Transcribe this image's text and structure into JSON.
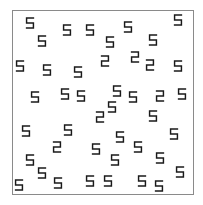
{
  "frame": {
    "x": 12,
    "y": 10,
    "width": 182,
    "height": 185,
    "border_color": "#8a8a8a"
  },
  "glyph_color": "#1a1a1a",
  "glyphs": [
    {
      "char": "5",
      "x": 30,
      "y": 23
    },
    {
      "char": "5",
      "x": 42,
      "y": 41
    },
    {
      "char": "5",
      "x": 67,
      "y": 30
    },
    {
      "char": "5",
      "x": 90,
      "y": 30
    },
    {
      "char": "5",
      "x": 110,
      "y": 42
    },
    {
      "char": "5",
      "x": 128,
      "y": 27
    },
    {
      "char": "5",
      "x": 153,
      "y": 40
    },
    {
      "char": "5",
      "x": 178,
      "y": 20
    },
    {
      "char": "5",
      "x": 20,
      "y": 66
    },
    {
      "char": "5",
      "x": 47,
      "y": 70
    },
    {
      "char": "5",
      "x": 78,
      "y": 72
    },
    {
      "char": "2",
      "x": 105,
      "y": 61
    },
    {
      "char": "2",
      "x": 135,
      "y": 57
    },
    {
      "char": "2",
      "x": 150,
      "y": 65
    },
    {
      "char": "5",
      "x": 178,
      "y": 66
    },
    {
      "char": "5",
      "x": 35,
      "y": 97
    },
    {
      "char": "5",
      "x": 65,
      "y": 94
    },
    {
      "char": "5",
      "x": 81,
      "y": 96
    },
    {
      "char": "5",
      "x": 117,
      "y": 91
    },
    {
      "char": "5",
      "x": 133,
      "y": 97
    },
    {
      "char": "2",
      "x": 160,
      "y": 96
    },
    {
      "char": "5",
      "x": 182,
      "y": 94
    },
    {
      "char": "2",
      "x": 100,
      "y": 117
    },
    {
      "char": "5",
      "x": 112,
      "y": 107
    },
    {
      "char": "5",
      "x": 153,
      "y": 116
    },
    {
      "char": "5",
      "x": 26,
      "y": 131
    },
    {
      "char": "5",
      "x": 68,
      "y": 130
    },
    {
      "char": "2",
      "x": 57,
      "y": 147
    },
    {
      "char": "5",
      "x": 96,
      "y": 149
    },
    {
      "char": "5",
      "x": 120,
      "y": 137
    },
    {
      "char": "5",
      "x": 138,
      "y": 147
    },
    {
      "char": "5",
      "x": 174,
      "y": 134
    },
    {
      "char": "5",
      "x": 30,
      "y": 160
    },
    {
      "char": "5",
      "x": 115,
      "y": 160
    },
    {
      "char": "5",
      "x": 160,
      "y": 158
    },
    {
      "char": "5",
      "x": 42,
      "y": 173
    },
    {
      "char": "5",
      "x": 58,
      "y": 183
    },
    {
      "char": "5",
      "x": 19,
      "y": 185
    },
    {
      "char": "5",
      "x": 90,
      "y": 181
    },
    {
      "char": "5",
      "x": 108,
      "y": 181
    },
    {
      "char": "5",
      "x": 142,
      "y": 181
    },
    {
      "char": "5",
      "x": 159,
      "y": 186
    },
    {
      "char": "5",
      "x": 180,
      "y": 172
    }
  ]
}
